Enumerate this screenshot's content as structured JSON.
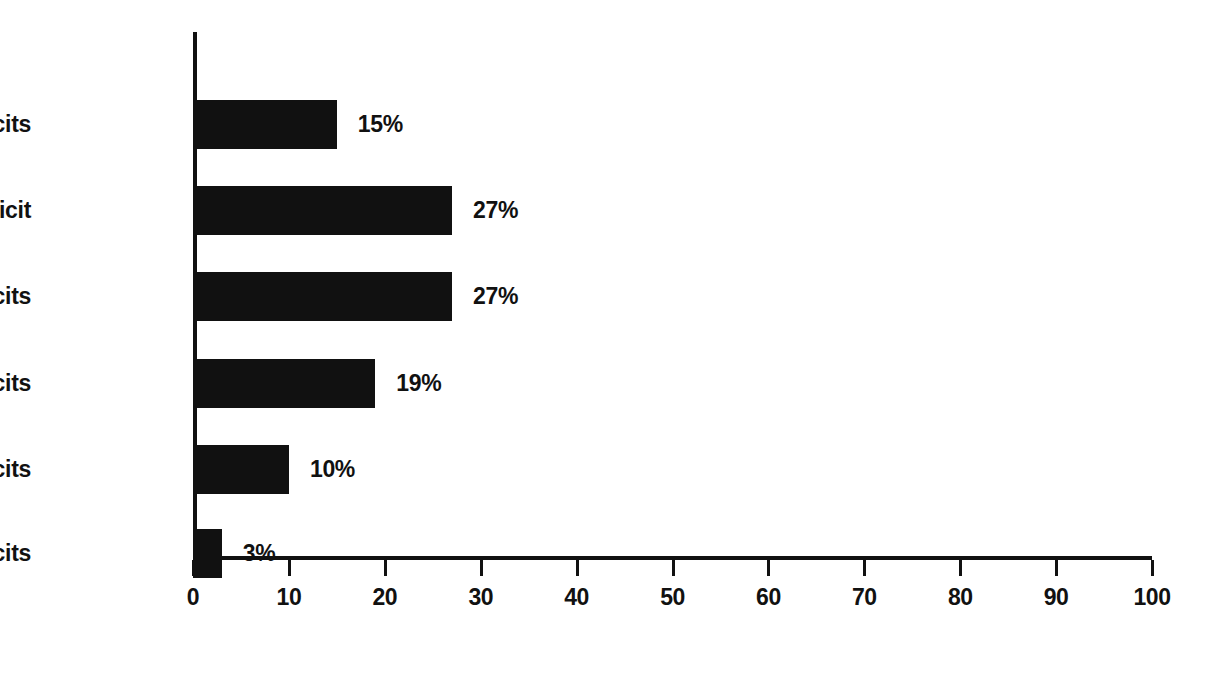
{
  "chart_data": {
    "type": "bar",
    "orientation": "horizontal",
    "title": "",
    "subtitle": "",
    "xlabel": "",
    "ylabel": "",
    "categories": [
      "0 deficits",
      "1 deficit",
      "2 deficits",
      "3 deficits",
      "4 deficits",
      "5 deficits"
    ],
    "values": [
      15,
      27,
      27,
      19,
      10,
      3
    ],
    "data_labels": [
      "15%",
      "27%",
      "27%",
      "19%",
      "10%",
      "3%"
    ],
    "xlim": [
      0,
      100
    ],
    "xticks": [
      0,
      10,
      20,
      30,
      40,
      50,
      60,
      70,
      80,
      90,
      100
    ],
    "xtick_labels": [
      "0",
      "10",
      "20",
      "30",
      "40",
      "50",
      "60",
      "70",
      "80",
      "90",
      "100"
    ],
    "grid": false,
    "legend": null,
    "legend_position": "none",
    "bar_color": "#111111",
    "axis_color": "#111111",
    "background_color": "#ffffff",
    "annotations": []
  },
  "geometry": {
    "bar_centers_px": [
      92,
      178,
      264,
      351,
      437,
      521
    ],
    "bar_height_px": 49,
    "unit_px": 9.59
  }
}
